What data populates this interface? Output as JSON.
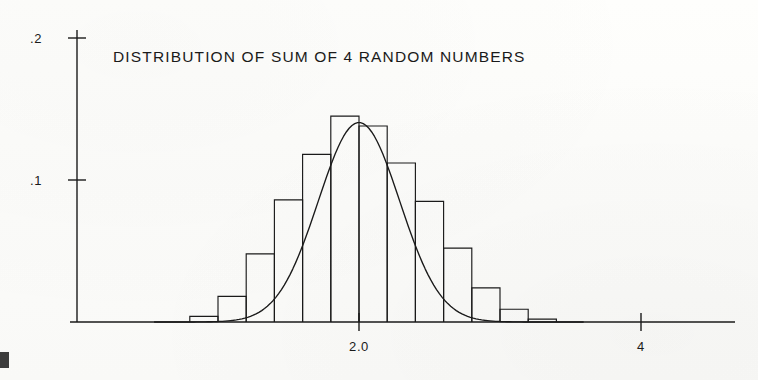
{
  "figure": {
    "title": "DISTRIBUTION OF SUM OF 4 RANDOM NUMBERS",
    "background_color": "#fdfdfb",
    "ink_color": "#1a1a1a"
  },
  "axes": {
    "y_tick_labels": [
      ".2",
      ".1"
    ],
    "x_tick_labels": [
      "2.0",
      "4"
    ]
  },
  "chart_data": {
    "type": "bar",
    "title": "DISTRIBUTION OF SUM OF 4 RANDOM NUMBERS",
    "subtitle": "",
    "xlabel": "",
    "ylabel": "",
    "xlim": [
      -0.8,
      7.33
    ],
    "ylim": [
      0,
      0.225
    ],
    "grid": false,
    "legend": null,
    "x_ticks": [
      2.0,
      4.0
    ],
    "x_tick_labels": [
      "2.0",
      "4"
    ],
    "y_ticks": [
      0.1,
      0.2
    ],
    "y_tick_labels": [
      ".1",
      ".2"
    ],
    "bin_width": 0.4,
    "bin_edges": [
      -0.4,
      0.0,
      0.4,
      0.8,
      1.2,
      1.6,
      2.0,
      2.4,
      2.8,
      3.2,
      3.6,
      4.0,
      4.4,
      4.8
    ],
    "bin_centers": [
      -0.2,
      0.2,
      0.6,
      1.0,
      1.4,
      1.8,
      2.2,
      2.6,
      3.0,
      3.4,
      3.8,
      4.2,
      4.6
    ],
    "categories": [
      "-0.4 to 0.0",
      "0.0 to 0.4",
      "0.4 to 0.8",
      "0.8 to 1.2",
      "1.2 to 1.6",
      "1.6 to 2.0",
      "2.0 to 2.4",
      "2.4 to 2.8",
      "2.8 to 3.2",
      "3.2 to 3.6",
      "3.6 to 4.0",
      "4.0 to 4.4",
      "4.4 to 4.8"
    ],
    "values": [
      0.004,
      0.018,
      0.048,
      0.086,
      0.118,
      0.145,
      0.138,
      0.112,
      0.085,
      0.052,
      0.024,
      0.009,
      0.002
    ],
    "series": [
      {
        "name": "histogram",
        "type": "bar",
        "values": [
          0.004,
          0.018,
          0.048,
          0.086,
          0.118,
          0.145,
          0.138,
          0.112,
          0.085,
          0.052,
          0.024,
          0.009,
          0.002
        ]
      },
      {
        "name": "normal-curve",
        "type": "line",
        "mean": 2.0,
        "sigma": 0.577,
        "peak": 0.1405,
        "x": [
          -0.6,
          -0.3,
          0.0,
          0.2,
          0.4,
          0.6,
          0.8,
          1.0,
          1.2,
          1.4,
          1.6,
          1.8,
          2.0,
          2.2,
          2.4,
          2.6,
          2.8,
          3.0,
          3.2,
          3.4,
          3.6,
          3.8,
          4.0,
          4.3,
          4.6,
          5.0
        ],
        "values": [
          0.0003,
          0.0016,
          0.0055,
          0.0108,
          0.0193,
          0.0319,
          0.0488,
          0.0692,
          0.0907,
          0.11,
          0.1257,
          0.136,
          0.1405,
          0.136,
          0.1257,
          0.11,
          0.0907,
          0.0692,
          0.0488,
          0.0319,
          0.0193,
          0.0108,
          0.0055,
          0.0018,
          0.0005,
          0.0001
        ]
      }
    ]
  }
}
